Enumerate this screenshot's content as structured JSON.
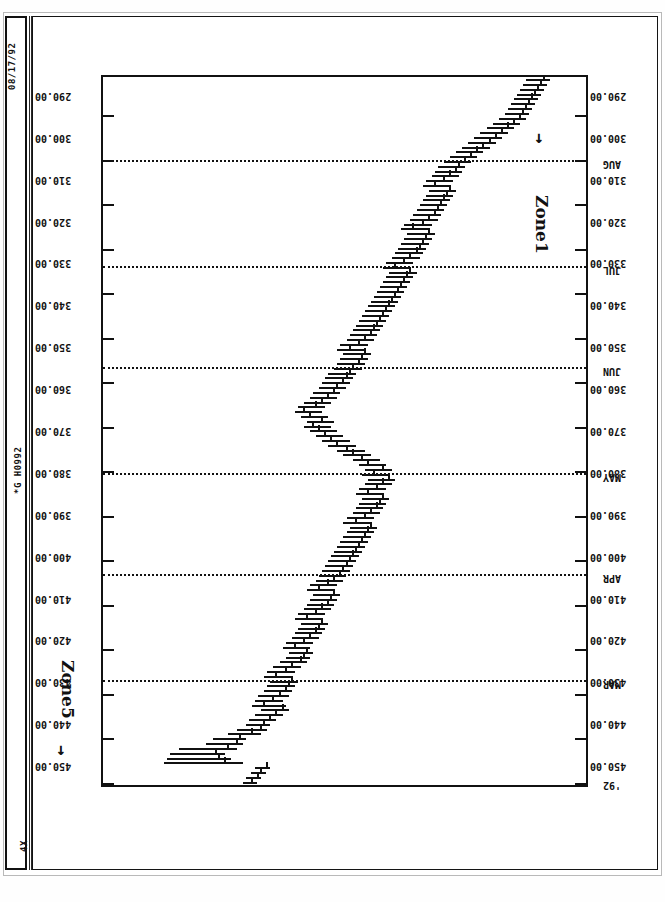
{
  "sheet": {
    "print_date": "08/17/92",
    "document_id": "*G H0992",
    "scale_label": "4X"
  },
  "annotations": [
    {
      "label": "Zone5",
      "arrow": "→"
    },
    {
      "label": "Zone1",
      "arrow": "→"
    }
  ],
  "chart_data": {
    "type": "ohlc",
    "title": "",
    "subtitle": "",
    "xlabel": "",
    "ylabel": "",
    "grid": true,
    "orientation": "rotated-90",
    "ylim": [
      290,
      450
    ],
    "ytick_step": 10,
    "ytick_labels": [
      "450.00",
      "440.00",
      "430.00",
      "420.00",
      "410.00",
      "400.00",
      "390.00",
      "380.00",
      "370.00",
      "360.00",
      "350.00",
      "340.00",
      "330.00",
      "320.00",
      "310.00",
      "300.00",
      "290.00"
    ],
    "ytick_values": [
      450,
      440,
      430,
      420,
      410,
      400,
      390,
      380,
      370,
      360,
      350,
      340,
      330,
      320,
      310,
      300,
      290
    ],
    "xtick_labels": [
      "'92",
      "MAR",
      "APR",
      "MAY",
      "JUN",
      "JUL",
      "AUG"
    ],
    "xtick_positions": [
      0,
      21,
      43,
      64,
      86,
      107,
      129
    ],
    "gridline_positions": [
      21,
      43,
      64,
      86,
      107,
      129
    ],
    "n_bars": 148,
    "series_name": "price",
    "bars": [
      {
        "i": 0,
        "h": 404.0,
        "l": 399.5,
        "c": 401.0
      },
      {
        "i": 1,
        "h": 403.0,
        "l": 398.0,
        "c": 399.0
      },
      {
        "i": 2,
        "h": 401.5,
        "l": 396.5,
        "c": 398.0
      },
      {
        "i": 3,
        "h": 400.0,
        "l": 395.0,
        "c": 396.0
      },
      {
        "i": 4,
        "h": 430.0,
        "l": 404.0,
        "c": 410.0
      },
      {
        "i": 5,
        "h": 429.0,
        "l": 408.0,
        "c": 412.0
      },
      {
        "i": 6,
        "h": 428.0,
        "l": 410.0,
        "c": 413.0
      },
      {
        "i": 7,
        "h": 425.0,
        "l": 406.0,
        "c": 409.0
      },
      {
        "i": 8,
        "h": 416.0,
        "l": 404.0,
        "c": 406.0
      },
      {
        "i": 9,
        "h": 414.0,
        "l": 403.0,
        "c": 405.0
      },
      {
        "i": 10,
        "h": 409.0,
        "l": 398.0,
        "c": 401.0
      },
      {
        "i": 11,
        "h": 406.0,
        "l": 396.0,
        "c": 398.0
      },
      {
        "i": 12,
        "h": 403.0,
        "l": 395.0,
        "c": 397.0
      },
      {
        "i": 13,
        "h": 402.0,
        "l": 393.0,
        "c": 395.0
      },
      {
        "i": 14,
        "h": 400.0,
        "l": 391.0,
        "c": 393.0
      },
      {
        "i": 15,
        "h": 398.0,
        "l": 389.0,
        "c": 391.0
      },
      {
        "i": 16,
        "h": 401.0,
        "l": 390.0,
        "c": 397.0
      },
      {
        "i": 17,
        "h": 400.0,
        "l": 391.0,
        "c": 394.0
      },
      {
        "i": 18,
        "h": 399.0,
        "l": 389.0,
        "c": 392.0
      },
      {
        "i": 19,
        "h": 397.0,
        "l": 388.0,
        "c": 390.0
      },
      {
        "i": 20,
        "h": 396.0,
        "l": 387.0,
        "c": 389.0
      },
      {
        "i": 21,
        "h": 395.0,
        "l": 386.0,
        "c": 388.0
      },
      {
        "i": 22,
        "h": 397.0,
        "l": 388.0,
        "c": 393.0
      },
      {
        "i": 23,
        "h": 396.0,
        "l": 387.0,
        "c": 390.0
      },
      {
        "i": 24,
        "h": 394.0,
        "l": 385.0,
        "c": 388.0
      },
      {
        "i": 25,
        "h": 392.0,
        "l": 383.0,
        "c": 385.0
      },
      {
        "i": 26,
        "h": 390.0,
        "l": 382.0,
        "c": 384.0
      },
      {
        "i": 27,
        "h": 389.0,
        "l": 381.0,
        "c": 383.0
      },
      {
        "i": 28,
        "h": 391.0,
        "l": 382.0,
        "c": 387.0
      },
      {
        "i": 29,
        "h": 390.0,
        "l": 381.0,
        "c": 384.0
      },
      {
        "i": 30,
        "h": 388.0,
        "l": 379.0,
        "c": 382.0
      },
      {
        "i": 31,
        "h": 387.0,
        "l": 378.0,
        "c": 380.0
      },
      {
        "i": 32,
        "h": 386.0,
        "l": 377.0,
        "c": 379.0
      },
      {
        "i": 33,
        "h": 385.0,
        "l": 376.0,
        "c": 378.0
      },
      {
        "i": 34,
        "h": 387.0,
        "l": 378.0,
        "c": 383.0
      },
      {
        "i": 35,
        "h": 386.0,
        "l": 377.0,
        "c": 380.0
      },
      {
        "i": 36,
        "h": 384.0,
        "l": 375.0,
        "c": 378.0
      },
      {
        "i": 37,
        "h": 383.0,
        "l": 374.0,
        "c": 376.0
      },
      {
        "i": 38,
        "h": 382.0,
        "l": 373.0,
        "c": 375.0
      },
      {
        "i": 39,
        "h": 381.0,
        "l": 372.0,
        "c": 374.0
      },
      {
        "i": 40,
        "h": 383.0,
        "l": 374.0,
        "c": 379.0
      },
      {
        "i": 41,
        "h": 382.0,
        "l": 373.0,
        "c": 376.0
      },
      {
        "i": 42,
        "h": 380.0,
        "l": 371.0,
        "c": 374.0
      },
      {
        "i": 43,
        "h": 379.0,
        "l": 370.0,
        "c": 372.0
      },
      {
        "i": 44,
        "h": 378.0,
        "l": 369.0,
        "c": 371.0
      },
      {
        "i": 45,
        "h": 377.0,
        "l": 368.0,
        "c": 370.0
      },
      {
        "i": 46,
        "h": 376.0,
        "l": 367.0,
        "c": 369.0
      },
      {
        "i": 47,
        "h": 375.0,
        "l": 366.0,
        "c": 368.0
      },
      {
        "i": 48,
        "h": 374.0,
        "l": 365.0,
        "c": 367.0
      },
      {
        "i": 49,
        "h": 373.0,
        "l": 364.0,
        "c": 366.0
      },
      {
        "i": 50,
        "h": 372.0,
        "l": 363.0,
        "c": 365.0
      },
      {
        "i": 51,
        "h": 371.0,
        "l": 362.0,
        "c": 364.0
      },
      {
        "i": 52,
        "h": 370.0,
        "l": 361.0,
        "c": 363.0
      },
      {
        "i": 53,
        "h": 369.0,
        "l": 360.0,
        "c": 362.0
      },
      {
        "i": 54,
        "h": 371.0,
        "l": 362.0,
        "c": 367.0
      },
      {
        "i": 55,
        "h": 370.0,
        "l": 361.0,
        "c": 364.0
      },
      {
        "i": 56,
        "h": 368.0,
        "l": 359.0,
        "c": 362.0
      },
      {
        "i": 57,
        "h": 367.0,
        "l": 358.0,
        "c": 360.0
      },
      {
        "i": 58,
        "h": 366.0,
        "l": 357.0,
        "c": 359.0
      },
      {
        "i": 59,
        "h": 365.0,
        "l": 356.0,
        "c": 358.0
      },
      {
        "i": 60,
        "h": 367.0,
        "l": 358.0,
        "c": 363.0
      },
      {
        "i": 61,
        "h": 366.0,
        "l": 357.0,
        "c": 360.0
      },
      {
        "i": 62,
        "h": 364.0,
        "l": 355.0,
        "c": 358.0
      },
      {
        "i": 63,
        "h": 363.0,
        "l": 354.0,
        "c": 356.0
      },
      {
        "i": 64,
        "h": 365.0,
        "l": 356.0,
        "c": 361.0
      },
      {
        "i": 65,
        "h": 364.0,
        "l": 355.0,
        "c": 358.0
      },
      {
        "i": 66,
        "h": 366.0,
        "l": 357.0,
        "c": 363.0
      },
      {
        "i": 67,
        "h": 368.0,
        "l": 359.0,
        "c": 365.0
      },
      {
        "i": 68,
        "h": 371.0,
        "l": 362.0,
        "c": 368.0
      },
      {
        "i": 69,
        "h": 373.0,
        "l": 364.0,
        "c": 370.0
      },
      {
        "i": 70,
        "h": 376.0,
        "l": 367.0,
        "c": 373.0
      },
      {
        "i": 71,
        "h": 378.0,
        "l": 369.0,
        "c": 375.0
      },
      {
        "i": 72,
        "h": 380.0,
        "l": 371.0,
        "c": 377.0
      },
      {
        "i": 73,
        "h": 382.0,
        "l": 373.0,
        "c": 379.0
      },
      {
        "i": 74,
        "h": 384.0,
        "l": 375.0,
        "c": 381.0
      },
      {
        "i": 75,
        "h": 383.0,
        "l": 374.0,
        "c": 378.0
      },
      {
        "i": 76,
        "h": 385.0,
        "l": 376.0,
        "c": 382.0
      },
      {
        "i": 77,
        "h": 387.0,
        "l": 378.0,
        "c": 384.0
      },
      {
        "i": 78,
        "h": 386.0,
        "l": 377.0,
        "c": 380.0
      },
      {
        "i": 79,
        "h": 384.0,
        "l": 375.0,
        "c": 378.0
      },
      {
        "i": 80,
        "h": 382.0,
        "l": 373.0,
        "c": 376.0
      },
      {
        "i": 81,
        "h": 381.0,
        "l": 372.0,
        "c": 374.0
      },
      {
        "i": 82,
        "h": 379.0,
        "l": 370.0,
        "c": 373.0
      },
      {
        "i": 83,
        "h": 378.0,
        "l": 369.0,
        "c": 371.0
      },
      {
        "i": 84,
        "h": 377.0,
        "l": 368.0,
        "c": 370.0
      },
      {
        "i": 85,
        "h": 376.0,
        "l": 367.0,
        "c": 369.0
      },
      {
        "i": 86,
        "h": 374.0,
        "l": 365.0,
        "c": 368.0
      },
      {
        "i": 87,
        "h": 373.0,
        "l": 364.0,
        "c": 366.0
      },
      {
        "i": 88,
        "h": 372.0,
        "l": 363.0,
        "c": 365.0
      },
      {
        "i": 89,
        "h": 371.0,
        "l": 362.0,
        "c": 364.0
      },
      {
        "i": 90,
        "h": 373.0,
        "l": 364.0,
        "c": 369.0
      },
      {
        "i": 91,
        "h": 372.0,
        "l": 363.0,
        "c": 366.0
      },
      {
        "i": 92,
        "h": 370.0,
        "l": 361.0,
        "c": 364.0
      },
      {
        "i": 93,
        "h": 369.0,
        "l": 360.0,
        "c": 362.0
      },
      {
        "i": 94,
        "h": 368.0,
        "l": 359.0,
        "c": 361.0
      },
      {
        "i": 95,
        "h": 367.0,
        "l": 358.0,
        "c": 360.0
      },
      {
        "i": 96,
        "h": 366.0,
        "l": 357.0,
        "c": 359.0
      },
      {
        "i": 97,
        "h": 365.0,
        "l": 356.0,
        "c": 358.0
      },
      {
        "i": 98,
        "h": 364.0,
        "l": 355.0,
        "c": 357.0
      },
      {
        "i": 99,
        "h": 363.0,
        "l": 354.0,
        "c": 356.0
      },
      {
        "i": 100,
        "h": 362.0,
        "l": 353.0,
        "c": 355.0
      },
      {
        "i": 101,
        "h": 361.0,
        "l": 352.0,
        "c": 354.0
      },
      {
        "i": 102,
        "h": 360.0,
        "l": 351.0,
        "c": 353.0
      },
      {
        "i": 103,
        "h": 359.0,
        "l": 350.0,
        "c": 352.0
      },
      {
        "i": 104,
        "h": 358.0,
        "l": 349.0,
        "c": 351.0
      },
      {
        "i": 105,
        "h": 357.0,
        "l": 348.0,
        "c": 350.0
      },
      {
        "i": 106,
        "h": 356.0,
        "l": 347.0,
        "c": 349.0
      },
      {
        "i": 107,
        "h": 358.0,
        "l": 349.0,
        "c": 354.0
      },
      {
        "i": 108,
        "h": 357.0,
        "l": 348.0,
        "c": 351.0
      },
      {
        "i": 109,
        "h": 355.0,
        "l": 346.0,
        "c": 349.0
      },
      {
        "i": 110,
        "h": 354.0,
        "l": 345.0,
        "c": 347.0
      },
      {
        "i": 111,
        "h": 353.0,
        "l": 344.0,
        "c": 346.0
      },
      {
        "i": 112,
        "h": 352.0,
        "l": 343.0,
        "c": 345.0
      },
      {
        "i": 113,
        "h": 351.0,
        "l": 342.0,
        "c": 344.0
      },
      {
        "i": 114,
        "h": 350.0,
        "l": 341.0,
        "c": 343.0
      },
      {
        "i": 115,
        "h": 352.0,
        "l": 343.0,
        "c": 348.0
      },
      {
        "i": 116,
        "h": 351.0,
        "l": 342.0,
        "c": 345.0
      },
      {
        "i": 117,
        "h": 349.0,
        "l": 340.0,
        "c": 343.0
      },
      {
        "i": 118,
        "h": 348.0,
        "l": 339.0,
        "c": 341.0
      },
      {
        "i": 119,
        "h": 347.0,
        "l": 338.0,
        "c": 340.0
      },
      {
        "i": 120,
        "h": 346.0,
        "l": 337.0,
        "c": 339.0
      },
      {
        "i": 121,
        "h": 345.0,
        "l": 336.0,
        "c": 338.0
      },
      {
        "i": 122,
        "h": 344.0,
        "l": 335.0,
        "c": 337.0
      },
      {
        "i": 123,
        "h": 343.0,
        "l": 334.0,
        "c": 336.0
      },
      {
        "i": 124,
        "h": 345.0,
        "l": 336.0,
        "c": 341.0
      },
      {
        "i": 125,
        "h": 344.0,
        "l": 335.0,
        "c": 338.0
      },
      {
        "i": 126,
        "h": 342.0,
        "l": 333.0,
        "c": 336.0
      },
      {
        "i": 127,
        "h": 341.0,
        "l": 332.0,
        "c": 334.0
      },
      {
        "i": 128,
        "h": 340.0,
        "l": 331.0,
        "c": 333.0
      },
      {
        "i": 129,
        "h": 338.0,
        "l": 329.0,
        "c": 331.0
      },
      {
        "i": 130,
        "h": 336.0,
        "l": 327.0,
        "c": 329.0
      },
      {
        "i": 131,
        "h": 334.0,
        "l": 325.0,
        "c": 327.0
      },
      {
        "i": 132,
        "h": 332.0,
        "l": 323.0,
        "c": 325.0
      },
      {
        "i": 133,
        "h": 330.0,
        "l": 321.0,
        "c": 323.0
      },
      {
        "i": 134,
        "h": 328.0,
        "l": 319.0,
        "c": 321.0
      },
      {
        "i": 135,
        "h": 326.0,
        "l": 317.0,
        "c": 319.0
      },
      {
        "i": 136,
        "h": 324.0,
        "l": 315.0,
        "c": 317.0
      },
      {
        "i": 137,
        "h": 322.0,
        "l": 313.0,
        "c": 315.0
      },
      {
        "i": 138,
        "h": 320.0,
        "l": 311.0,
        "c": 313.0
      },
      {
        "i": 139,
        "h": 318.0,
        "l": 310.0,
        "c": 312.0
      },
      {
        "i": 140,
        "h": 317.0,
        "l": 309.0,
        "c": 311.0
      },
      {
        "i": 141,
        "h": 316.0,
        "l": 308.0,
        "c": 310.0
      },
      {
        "i": 142,
        "h": 315.0,
        "l": 307.0,
        "c": 309.0
      },
      {
        "i": 143,
        "h": 314.0,
        "l": 306.0,
        "c": 308.0
      },
      {
        "i": 144,
        "h": 313.0,
        "l": 305.0,
        "c": 307.0
      },
      {
        "i": 145,
        "h": 312.0,
        "l": 304.0,
        "c": 306.0
      },
      {
        "i": 146,
        "h": 311.0,
        "l": 303.0,
        "c": 305.0
      },
      {
        "i": 147,
        "h": 310.0,
        "l": 302.0,
        "c": 304.0
      }
    ]
  }
}
